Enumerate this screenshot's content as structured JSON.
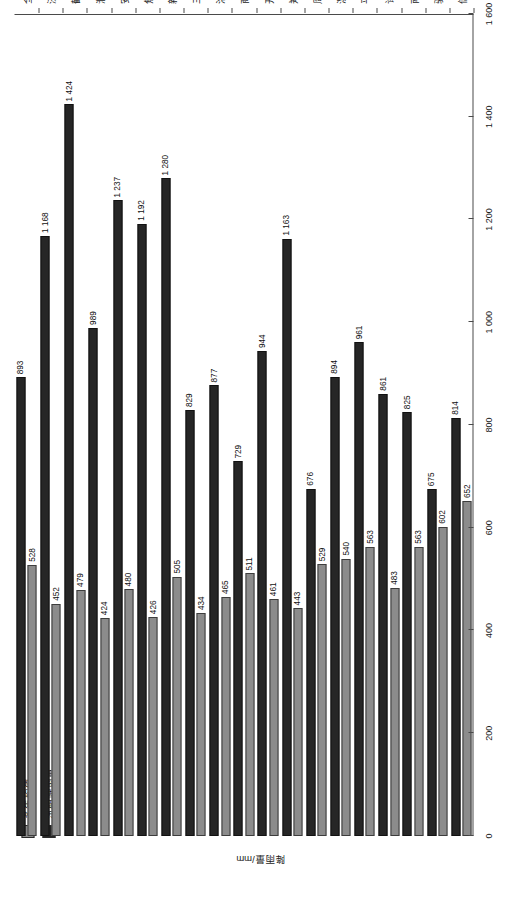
{
  "chart_data": {
    "type": "bar",
    "orientation": "horizontal",
    "title": "",
    "xlabel": "降雨量/mm",
    "ylabel": "",
    "xlim": [
      0,
      1600
    ],
    "xticks": [
      "0",
      "200",
      "400",
      "600",
      "800",
      "1 000",
      "1 200",
      "1 400",
      "1 600"
    ],
    "xtick_values": [
      0,
      200,
      400,
      600,
      800,
      1000,
      1200,
      1400,
      1600
    ],
    "grid": false,
    "legend_position": "top-left",
    "categories": [
      "信阳",
      "驻马店",
      "南阳",
      "许昌",
      "平顶山",
      "漯河",
      "周口",
      "郑州",
      "开封",
      "商丘",
      "洛阳",
      "三门峡",
      "新乡",
      "焦作",
      "安阳",
      "濮阳",
      "鹤壁",
      "济源",
      "全省"
    ],
    "series": [
      {
        "name": "汛期降雨量",
        "color": "#262626",
        "values": [
          814,
          675,
          825,
          861,
          961,
          894,
          676,
          1163,
          944,
          729,
          877,
          829,
          1280,
          1192,
          1237,
          989,
          1424,
          1168,
          893
        ],
        "labels": [
          "814",
          "675",
          "825",
          "861",
          "961",
          "894",
          "676",
          "1 163",
          "944",
          "729",
          "877",
          "829",
          "1 280",
          "1 192",
          "1 237",
          "989",
          "1 424",
          "1 168",
          "893"
        ]
      },
      {
        "name": "多年均值",
        "color": "#8c8c8c",
        "values": [
          652,
          602,
          563,
          483,
          563,
          540,
          529,
          443,
          461,
          511,
          465,
          434,
          505,
          426,
          480,
          424,
          479,
          452,
          528
        ],
        "labels": [
          "652",
          "602",
          "563",
          "483",
          "563",
          "540",
          "529",
          "443",
          "461",
          "511",
          "465",
          "434",
          "505",
          "426",
          "480",
          "424",
          "479",
          "452",
          "528"
        ]
      }
    ]
  },
  "legend": {
    "items": [
      {
        "label": "多年均值",
        "swatch": "avg"
      },
      {
        "label": "汛期降雨量",
        "swatch": "flood"
      }
    ]
  },
  "axis": {
    "value_axis_title": "降雨量/mm"
  }
}
